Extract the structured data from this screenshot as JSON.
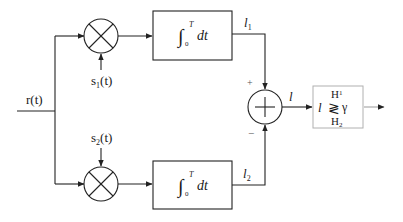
{
  "diagram": {
    "type": "correlation-receiver-block-diagram",
    "input": {
      "label": "r(t)"
    },
    "branches": [
      {
        "multiplier_reference": "s",
        "reference_subscript": "1",
        "reference_suffix": "(t)",
        "integrator": {
          "prefix": "∫",
          "upper": "T",
          "lower": "0",
          "body": "dt"
        },
        "output": {
          "name": "l",
          "subscript": "1"
        },
        "summer_sign": "+"
      },
      {
        "multiplier_reference": "s",
        "reference_subscript": "2",
        "reference_suffix": "(t)",
        "integrator": {
          "prefix": "∫",
          "upper": "T",
          "lower": "0",
          "body": "dt"
        },
        "output": {
          "name": "l",
          "subscript": "2"
        },
        "summer_sign": "−"
      }
    ],
    "summer": {
      "symbol": "+",
      "output_label": "l"
    },
    "decision": {
      "statistic": "l",
      "upper_hypothesis": "H",
      "upper_subscript": "1",
      "lower_hypothesis": "H",
      "lower_subscript": "2",
      "comparator": "≷",
      "threshold": "γ"
    }
  }
}
